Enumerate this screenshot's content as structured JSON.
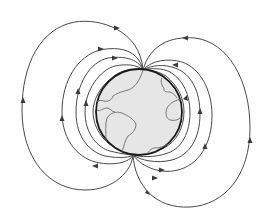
{
  "diagram": {
    "colors": {
      "background": "#ffffff",
      "globe_fill": "#e6e6e6",
      "globe_outline": "#1a1a1a",
      "field_lines": "#4a4a4a",
      "coastlines": "#6a6a6a"
    },
    "globe": {
      "cx": 139,
      "cy": 112,
      "r": 43
    },
    "poles": {
      "top": [
        143,
        70
      ],
      "bottom": [
        133,
        155
      ]
    }
  }
}
